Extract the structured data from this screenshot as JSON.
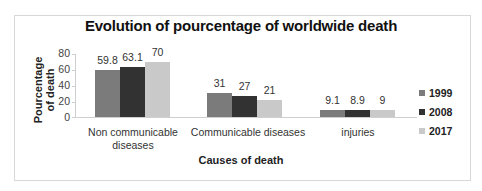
{
  "chart_data": {
    "type": "bar",
    "title": "Evolution of pourcentage of worldwide death",
    "xlabel": "Causes of death",
    "ylabel": "Pourcentage of death",
    "ylabel_lines": [
      "Pourcentage",
      "of death"
    ],
    "ylim": [
      0,
      80
    ],
    "yticks": [
      "0",
      "20",
      "40",
      "60",
      "80"
    ],
    "grid": false,
    "legend_position": "right",
    "categories": [
      "Non communicable diseases",
      "Communicable diseases",
      "injuries"
    ],
    "category_labels": [
      [
        "Non communicable",
        "diseases"
      ],
      [
        "Communicable diseases"
      ],
      [
        "injuries"
      ]
    ],
    "series": [
      {
        "name": "1999",
        "color": "#7b7b7b",
        "values": [
          59.8,
          31,
          9.1
        ],
        "labels": [
          "59.8",
          "31",
          "9.1"
        ]
      },
      {
        "name": "2008",
        "color": "#323232",
        "values": [
          63.1,
          27,
          8.9
        ],
        "labels": [
          "63.1",
          "27",
          "8.9"
        ]
      },
      {
        "name": "2017",
        "color": "#c9c9c9",
        "values": [
          70,
          21,
          9
        ],
        "labels": [
          "70",
          "21",
          "9"
        ]
      }
    ]
  }
}
